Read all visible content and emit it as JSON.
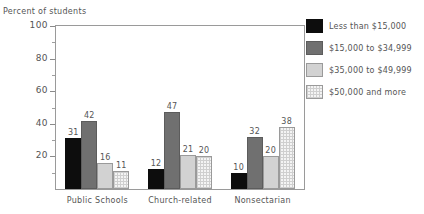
{
  "chart_data": {
    "type": "bar",
    "title": "",
    "ylabel": "Percent of students",
    "xlabel": "",
    "ylim": [
      0,
      100
    ],
    "yticks": [
      0,
      20,
      40,
      60,
      80,
      100
    ],
    "ytick_labels": [
      "20",
      "40",
      "60",
      "80",
      "100"
    ],
    "minor_tick_step": 10,
    "grid": false,
    "legend_position": "right",
    "categories": [
      "Public Schools",
      "Church-related",
      "Nonsectarian"
    ],
    "series": [
      {
        "name": "Less than $15,000",
        "color": "#0d0d0d",
        "values": [
          31,
          12,
          10
        ]
      },
      {
        "name": "$15,000 to $34,999",
        "color": "#707070",
        "values": [
          42,
          47,
          32
        ]
      },
      {
        "name": "$35,000 to $49,999",
        "color": "#d2d2d2",
        "values": [
          16,
          21,
          20
        ]
      },
      {
        "name": "$50,000 and more",
        "color": "#f4f4f4",
        "values": [
          11,
          20,
          38
        ]
      }
    ]
  }
}
